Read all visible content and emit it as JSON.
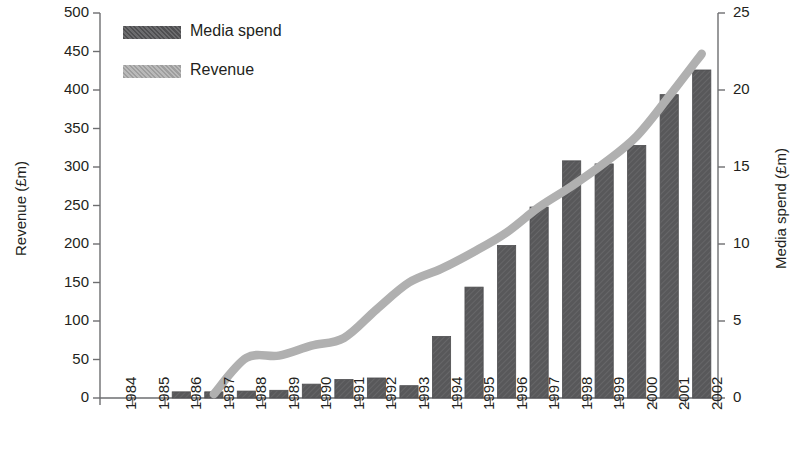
{
  "chart_data": {
    "type": "bar",
    "title": "",
    "subtitle": "",
    "xlabel": "",
    "ylabel": "Revenue (£m)",
    "y2label": "Media spend (£m)",
    "grid": false,
    "legend_position": "top-left",
    "categories": [
      "1984",
      "1985",
      "1986",
      "1987",
      "1988",
      "1989",
      "1990",
      "1991",
      "1992",
      "1993",
      "1994",
      "1995",
      "1996",
      "1997",
      "1998",
      "1999",
      "2000",
      "2001",
      "2002"
    ],
    "ylim": [
      0,
      500
    ],
    "y_ticks": [
      0,
      50,
      100,
      150,
      200,
      250,
      300,
      350,
      400,
      450,
      500
    ],
    "y2lim": [
      0,
      25
    ],
    "y2_ticks": [
      0,
      5,
      10,
      15,
      20,
      25
    ],
    "series": [
      {
        "name": "Media spend",
        "chart_type": "bar",
        "axis": "right",
        "unit": "£m",
        "color": "#58585a",
        "values": [
          0,
          0,
          0.4,
          0.4,
          0.45,
          0.5,
          0.9,
          1.2,
          1.3,
          0.8,
          4.0,
          7.2,
          9.9,
          12.4,
          15.4,
          15.2,
          16.4,
          19.7,
          21.3
        ]
      },
      {
        "name": "Revenue",
        "chart_type": "line",
        "axis": "left",
        "unit": "£m",
        "color": "#b0b0b0",
        "values": [
          null,
          null,
          null,
          5,
          52,
          55,
          68,
          78,
          115,
          150,
          168,
          190,
          215,
          248,
          275,
          305,
          340,
          392,
          447
        ]
      }
    ]
  },
  "legend": {
    "items": [
      {
        "label": "Media spend",
        "color": "#58585a"
      },
      {
        "label": "Revenue",
        "color": "#b0b0b0"
      }
    ]
  },
  "axes": {
    "left": {
      "title": "Revenue (£m)",
      "labels": [
        "500",
        "450",
        "400",
        "350",
        "300",
        "250",
        "200",
        "150",
        "100",
        "50",
        "0"
      ]
    },
    "right": {
      "title": "Media spend (£m)",
      "labels": [
        "25",
        "20",
        "15",
        "10",
        "5",
        "0"
      ]
    },
    "bottom": {
      "labels": [
        "1984",
        "1985",
        "1986",
        "1987",
        "1988",
        "1989",
        "1990",
        "1991",
        "1992",
        "1993",
        "1994",
        "1995",
        "1996",
        "1997",
        "1998",
        "1999",
        "2000",
        "2001",
        "2002"
      ]
    }
  }
}
